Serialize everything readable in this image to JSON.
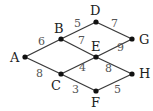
{
  "graph": {
    "nodes": [
      {
        "id": "A",
        "x": 25,
        "y": 57,
        "lx": 10,
        "ly": 62
      },
      {
        "id": "B",
        "x": 61,
        "y": 39,
        "lx": 54,
        "ly": 33
      },
      {
        "id": "D",
        "x": 96,
        "y": 22,
        "lx": 90,
        "ly": 15
      },
      {
        "id": "G",
        "x": 132,
        "y": 39,
        "lx": 139,
        "ly": 44
      },
      {
        "id": "E",
        "x": 96,
        "y": 57,
        "lx": 91,
        "ly": 51
      },
      {
        "id": "C",
        "x": 61,
        "y": 74,
        "lx": 51,
        "ly": 90
      },
      {
        "id": "F",
        "x": 96,
        "y": 91,
        "lx": 91,
        "ly": 107
      },
      {
        "id": "H",
        "x": 132,
        "y": 74,
        "lx": 139,
        "ly": 78
      }
    ],
    "edges": [
      {
        "from": "A",
        "to": "B",
        "weight": "6",
        "lx": 38,
        "ly": 45
      },
      {
        "from": "A",
        "to": "C",
        "weight": "8",
        "lx": 36,
        "ly": 77
      },
      {
        "from": "B",
        "to": "D",
        "weight": "5",
        "lx": 74,
        "ly": 27
      },
      {
        "from": "D",
        "to": "G",
        "weight": "7",
        "lx": 111,
        "ly": 27
      },
      {
        "from": "B",
        "to": "E",
        "weight": "7",
        "lx": 78,
        "ly": 44
      },
      {
        "from": "E",
        "to": "G",
        "weight": "9",
        "lx": 117,
        "ly": 51
      },
      {
        "from": "C",
        "to": "E",
        "weight": "4",
        "lx": 79,
        "ly": 71
      },
      {
        "from": "E",
        "to": "H",
        "weight": "8",
        "lx": 105,
        "ly": 72
      },
      {
        "from": "C",
        "to": "F",
        "weight": "3",
        "lx": 72,
        "ly": 93
      },
      {
        "from": "F",
        "to": "H",
        "weight": "5",
        "lx": 114,
        "ly": 93
      }
    ]
  }
}
